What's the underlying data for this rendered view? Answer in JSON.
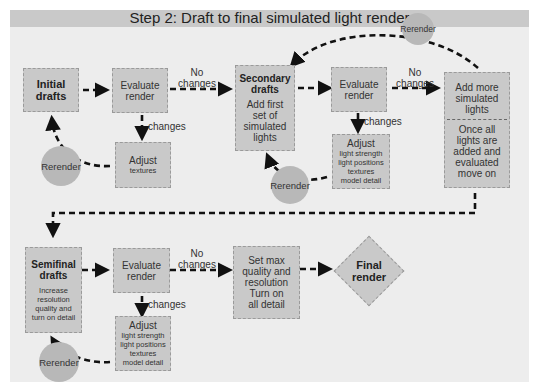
{
  "title": "Step 2: Draft to final simulated light render",
  "row1": {
    "initial": {
      "line1": "Initial",
      "line2": "drafts"
    },
    "evaluate": {
      "line1": "Evaluate",
      "line2": "render"
    },
    "no_changes": {
      "line1": "No",
      "line2": "changes"
    },
    "changes": "changes",
    "adjust": {
      "title": "Adjust",
      "detail": "textures"
    },
    "rerender": "Rerender"
  },
  "row2": {
    "secondary": {
      "line1": "Secondary",
      "line2": "drafts",
      "d1": "Add first",
      "d2": "set of",
      "d3": "simulated",
      "d4": "lights"
    },
    "evaluate": {
      "line1": "Evaluate",
      "line2": "render"
    },
    "no_changes": {
      "line1": "No",
      "line2": "changes"
    },
    "changes": "changes",
    "adjust": {
      "title": "Adjust",
      "d1": "light strength",
      "d2": "light positions",
      "d3": "textures",
      "d4": "model detail"
    },
    "rerender": "Rerender",
    "rerender_top": "Rerender",
    "more": {
      "a1": "Add more",
      "a2": "simulated",
      "a3": "lights",
      "b1": "Once all",
      "b2": "lights are",
      "b3": "added and",
      "b4": "evaluated",
      "b5": "move on"
    }
  },
  "row3": {
    "semifinal": {
      "line1": "Semifinal",
      "line2": "drafts",
      "d1": "Increase",
      "d2": "resolution",
      "d3": "quality and",
      "d4": "turn on detail"
    },
    "evaluate": {
      "line1": "Evaluate",
      "line2": "render"
    },
    "no_changes": {
      "line1": "No",
      "line2": "changes"
    },
    "changes": "changes",
    "adjust": {
      "title": "Adjust",
      "d1": "light strength",
      "d2": "light positions",
      "d3": "textures",
      "d4": "model detail"
    },
    "rerender": "Rerender",
    "setmax": {
      "l1": "Set max",
      "l2": "quality and",
      "l3": "resolution",
      "l4": "Turn on",
      "l5": "all detail"
    },
    "final": {
      "line1": "Final",
      "line2": "render"
    }
  }
}
